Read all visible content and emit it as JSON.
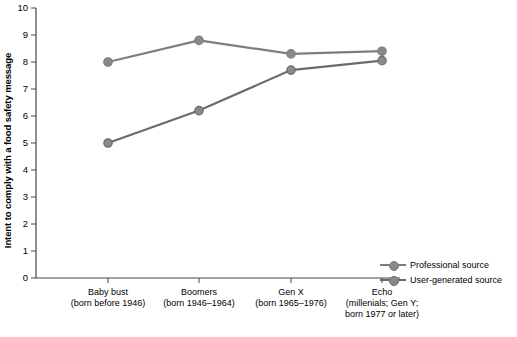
{
  "chart_data": {
    "type": "line",
    "title": "",
    "xlabel": "",
    "ylabel": "Intent to comply with a food safety message",
    "ylim": [
      0,
      10
    ],
    "yticks": [
      "0",
      "1",
      "2",
      "3",
      "4",
      "5",
      "6",
      "7",
      "8",
      "9",
      "10"
    ],
    "grid": false,
    "legend_position": "right",
    "categories": [
      "Baby bust\n(born before 1946)",
      "Boomers\n(born 1946–1964)",
      "Gen X\n(born 1965–1976)",
      "Echo\n(millenials; Gen Y;\nborn 1977 or later)"
    ],
    "series": [
      {
        "name": "Professional source",
        "values": [
          8.0,
          8.8,
          8.3,
          8.4
        ],
        "color": "#7d7d7d"
      },
      {
        "name": "User-generated source",
        "values": [
          5.0,
          6.2,
          7.7,
          8.05
        ],
        "color": "#6b6b6b"
      }
    ]
  },
  "legend": {
    "items": [
      {
        "label": "Professional source"
      },
      {
        "label": "User-generated source"
      }
    ]
  },
  "colors": {
    "axis": "#444444",
    "series1": "#7d7d7d",
    "series2": "#6b6b6b",
    "marker_fill": "#8a8a8a"
  }
}
